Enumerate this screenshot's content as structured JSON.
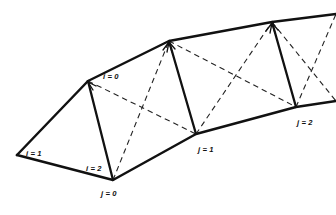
{
  "figure": {
    "background_color": "#ffffff",
    "line_color": "#111111",
    "dashed_color": "#222222"
  },
  "labels": [
    {
      "id": "i0",
      "text": "i = 0",
      "x": 103,
      "y": 79,
      "anchor": "start"
    },
    {
      "id": "i1",
      "text": "i = 1",
      "x": 26,
      "y": 156,
      "anchor": "start"
    },
    {
      "id": "i2",
      "text": "i = 2",
      "x": 86,
      "y": 171,
      "anchor": "start"
    },
    {
      "id": "j0",
      "text": "j = 0",
      "x": 101,
      "y": 196,
      "anchor": "start"
    },
    {
      "id": "j1",
      "text": "j = 1",
      "x": 198,
      "y": 152,
      "anchor": "start"
    },
    {
      "id": "j2",
      "text": "j = 2",
      "x": 297,
      "y": 125,
      "anchor": "start"
    }
  ],
  "nodes": {
    "top": [
      {
        "id": "t0",
        "x": 88,
        "y": 81
      },
      {
        "id": "t1",
        "x": 169,
        "y": 41
      },
      {
        "id": "t2",
        "x": 272,
        "y": 22
      },
      {
        "id": "t3",
        "x": 336,
        "y": 14
      }
    ],
    "bottom": [
      {
        "id": "b_left",
        "x": 17,
        "y": 155
      },
      {
        "id": "b0",
        "x": 113,
        "y": 180
      },
      {
        "id": "b1",
        "x": 196,
        "y": 134
      },
      {
        "id": "b2",
        "x": 296,
        "y": 107
      },
      {
        "id": "b3",
        "x": 336,
        "y": 101
      }
    ]
  },
  "solid_edges": [
    {
      "name": "upper-boundary",
      "points": "17,155 88,81 169,41 272,22 336,14"
    },
    {
      "name": "lower-boundary",
      "points": "17,155 113,180 196,134 296,107 336,101"
    },
    {
      "name": "rib-0",
      "points": "88,81 113,180"
    },
    {
      "name": "rib-1",
      "points": "169,41 196,134"
    },
    {
      "name": "rib-2",
      "points": "272,22 296,107"
    }
  ],
  "dashed_edges": [
    {
      "name": "cell0-diag-a",
      "points": "88,81 196,134"
    },
    {
      "name": "cell0-diag-b",
      "points": "113,180 169,41"
    },
    {
      "name": "cell1-diag-a",
      "points": "169,41 296,107"
    },
    {
      "name": "cell1-diag-b",
      "points": "196,134 272,22"
    },
    {
      "name": "cell2-diag-a",
      "points": "272,22 336,101"
    },
    {
      "name": "cell2-diag-b",
      "points": "296,107 336,14"
    }
  ],
  "arrow_targets": [
    {
      "name": "arrow-to-t1",
      "x": 169,
      "y": 41
    },
    {
      "name": "arrow-to-t2",
      "x": 272,
      "y": 22
    }
  ]
}
